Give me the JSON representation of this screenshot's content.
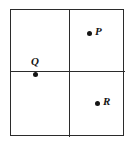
{
  "figure": {
    "type": "scatter-quadrant-diagram",
    "background_color": "#ffffff",
    "frame": {
      "name": "outer-square",
      "stroke_color": "#2b2b2b",
      "stroke_width_px": 1,
      "x_px": 10,
      "y_px": 9,
      "width_px": 114,
      "height_px": 127
    },
    "dividers": [
      {
        "name": "vertical-divider",
        "orientation": "vertical",
        "position_px": 68,
        "stroke_color": "#2b2b2b"
      },
      {
        "name": "horizontal-divider",
        "orientation": "horizontal",
        "position_px": 70,
        "stroke_color": "#2b2b2b"
      }
    ],
    "quadrants": [
      {
        "name": "top-left",
        "label": ""
      },
      {
        "name": "top-right",
        "label": ""
      },
      {
        "name": "bottom-left",
        "label": ""
      },
      {
        "name": "bottom-right",
        "label": ""
      }
    ]
  },
  "chart_data": {
    "type": "scatter",
    "title": "",
    "xlabel": "",
    "ylabel": "",
    "grid": true,
    "legend": "none",
    "xlim": [
      0,
      1
    ],
    "ylim": [
      0,
      1
    ],
    "gridlines": {
      "x": [
        0.51
      ],
      "y": [
        0.48
      ]
    },
    "marker_color": "#151515",
    "marker_shape": "circle",
    "points": [
      {
        "label": "P",
        "x": 0.596,
        "y": 0.89,
        "px": 78,
        "py": 23,
        "quadrant": "top-right",
        "label_position": "right"
      },
      {
        "label": "Q",
        "x": 0.123,
        "y": 0.567,
        "px": 24,
        "py": 64,
        "quadrant": "top-left",
        "label_position": "above"
      },
      {
        "label": "R",
        "x": 0.667,
        "y": 0.339,
        "px": 86,
        "py": 93,
        "quadrant": "bottom-right",
        "label_position": "right"
      }
    ]
  }
}
